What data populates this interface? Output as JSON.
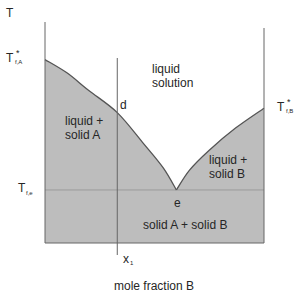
{
  "chart_data": {
    "type": "diagram",
    "xlabel": "mole fraction B",
    "ylabel": "T",
    "xlim": [
      0,
      1
    ],
    "ylim": [
      0,
      1
    ],
    "melting_point_A": {
      "label_main": "T",
      "label_sub": "f,A",
      "label_sup": "*",
      "T": 0.83
    },
    "melting_point_B": {
      "label_main": "T",
      "label_sub": "f,B",
      "label_sup": "*",
      "T": 0.61
    },
    "eutectic": {
      "label_main": "T",
      "label_sub": "f,e",
      "T": 0.24,
      "x": 0.6,
      "point_label": "e"
    },
    "liquidus_A": [
      [
        0,
        0.83
      ],
      [
        0.1,
        0.77
      ],
      [
        0.2,
        0.69
      ],
      [
        0.33,
        0.59
      ],
      [
        0.45,
        0.45
      ],
      [
        0.54,
        0.34
      ],
      [
        0.6,
        0.24
      ]
    ],
    "liquidus_B": [
      [
        0.6,
        0.24
      ],
      [
        0.66,
        0.33
      ],
      [
        0.75,
        0.42
      ],
      [
        0.87,
        0.52
      ],
      [
        1.0,
        0.61
      ]
    ],
    "composition_line": {
      "label_main": "x",
      "label_sub": "1",
      "x": 0.33
    },
    "point_d": {
      "label": "d",
      "x": 0.33,
      "T": 0.59
    },
    "regions": [
      {
        "name": "liquid-solution",
        "lines": [
          "liquid",
          "solution"
        ]
      },
      {
        "name": "liquid-solid-a",
        "lines": [
          "liquid +",
          "solid A"
        ]
      },
      {
        "name": "liquid-solid-b",
        "lines": [
          "liquid +",
          "solid B"
        ]
      },
      {
        "name": "solid-a-solid-b",
        "lines": [
          "solid A + solid B"
        ]
      }
    ],
    "colors": {
      "shaded": "#bdbdbd",
      "line": "#555555",
      "text": "#262626"
    }
  }
}
